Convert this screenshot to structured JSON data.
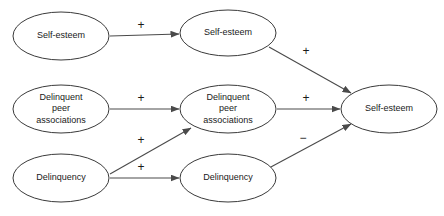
{
  "diagram": {
    "type": "path-model",
    "background_color": "#ffffff",
    "stroke_color": "#3a3a3a",
    "text_color": "#1a1a1a",
    "nodes": [
      {
        "id": "t1_self_esteem",
        "label": "Self-esteem",
        "lines": [
          "Self-esteem"
        ],
        "cx": 61,
        "cy": 36,
        "rx": 48,
        "ry": 24
      },
      {
        "id": "t1_dpa",
        "label": "Delinquent peer associations",
        "lines": [
          "Delinquent",
          "peer",
          "associations"
        ],
        "cx": 61,
        "cy": 109,
        "rx": 48,
        "ry": 24
      },
      {
        "id": "t1_delinquency",
        "label": "Delinquency",
        "lines": [
          "Delinquency"
        ],
        "cx": 61,
        "cy": 178,
        "rx": 48,
        "ry": 24
      },
      {
        "id": "t2_self_esteem",
        "label": "Self-esteem",
        "lines": [
          "Self-esteem"
        ],
        "cx": 228,
        "cy": 33,
        "rx": 48,
        "ry": 23
      },
      {
        "id": "t2_dpa",
        "label": "Delinquent peer associations",
        "lines": [
          "Delinquent",
          "peer",
          "associations"
        ],
        "cx": 228,
        "cy": 109,
        "rx": 48,
        "ry": 24
      },
      {
        "id": "t2_delinquency",
        "label": "Delinquency",
        "lines": [
          "Delinquency"
        ],
        "cx": 228,
        "cy": 178,
        "rx": 48,
        "ry": 24
      },
      {
        "id": "t3_self_esteem",
        "label": "Self-esteem",
        "lines": [
          "Self-esteem"
        ],
        "cx": 389,
        "cy": 109,
        "rx": 48,
        "ry": 24
      }
    ],
    "edges": [
      {
        "id": "e1",
        "from": "t1_self_esteem",
        "to": "t2_self_esteem",
        "sign": "+",
        "sign_x": 141,
        "sign_y": 26,
        "x1": 110,
        "y1": 36,
        "x2": 179,
        "y2": 34
      },
      {
        "id": "e2",
        "from": "t1_dpa",
        "to": "t2_dpa",
        "sign": "+",
        "sign_x": 141,
        "sign_y": 99,
        "x1": 110,
        "y1": 109,
        "x2": 179,
        "y2": 109
      },
      {
        "id": "e3",
        "from": "t1_delinquency",
        "to": "t2_delinquency",
        "sign": "+",
        "sign_x": 141,
        "sign_y": 168,
        "x1": 110,
        "y1": 178,
        "x2": 179,
        "y2": 178
      },
      {
        "id": "e4",
        "from": "t1_delinquency",
        "to": "t2_dpa",
        "sign": "+",
        "sign_x": 141,
        "sign_y": 141,
        "x1": 110,
        "y1": 174,
        "x2": 191,
        "y2": 128
      },
      {
        "id": "e5",
        "from": "t2_self_esteem",
        "to": "t3_self_esteem",
        "sign": "+",
        "sign_x": 306,
        "sign_y": 52,
        "x1": 269,
        "y1": 47,
        "x2": 351,
        "y2": 93
      },
      {
        "id": "e6",
        "from": "t2_dpa",
        "to": "t3_self_esteem",
        "sign": "+",
        "sign_x": 306,
        "sign_y": 99,
        "x1": 277,
        "y1": 109,
        "x2": 340,
        "y2": 109
      },
      {
        "id": "e7",
        "from": "t2_delinquency",
        "to": "t3_self_esteem",
        "sign": "−",
        "sign_x": 303,
        "sign_y": 139,
        "x1": 269,
        "y1": 168,
        "x2": 351,
        "y2": 124
      }
    ]
  }
}
